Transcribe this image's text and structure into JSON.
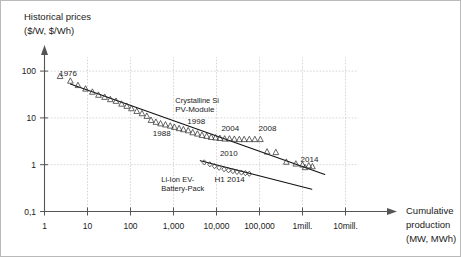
{
  "chart_data": {
    "type": "scatter",
    "title": "",
    "ylabel_lines": [
      "Historical prices",
      "($/W, $/Wh)"
    ],
    "xlabel_lines": [
      "Cumulative",
      "production",
      "(MW, MWh)"
    ],
    "xscale": "log",
    "yscale": "log",
    "xlim": [
      1,
      30000000
    ],
    "ylim": [
      0.1,
      300
    ],
    "grid": true,
    "legend_position": "inline-annotations",
    "xticks": [
      {
        "value": 1,
        "label": "1"
      },
      {
        "value": 10,
        "label": "10"
      },
      {
        "value": 100,
        "label": "100"
      },
      {
        "value": 1000,
        "label": "1,000"
      },
      {
        "value": 10000,
        "label": "10,000"
      },
      {
        "value": 100000,
        "label": "100,000"
      },
      {
        "value": 1000000,
        "label": "1mill."
      },
      {
        "value": 10000000,
        "label": "10mill."
      }
    ],
    "yticks": [
      {
        "value": 100,
        "label": "100"
      },
      {
        "value": 10,
        "label": "10"
      },
      {
        "value": 1,
        "label": "1"
      },
      {
        "value": 0.1,
        "label": "0,1"
      }
    ],
    "annotations": [
      {
        "id": "ann-1976",
        "text": "1976",
        "x": 2.2,
        "y": 80
      },
      {
        "id": "ann-1988",
        "text": "1988",
        "x": 330,
        "y": 4.1
      },
      {
        "id": "ann-1998",
        "text": "1998",
        "x": 2100,
        "y": 7.4
      },
      {
        "id": "ann-2004",
        "text": "2004",
        "x": 13000,
        "y": 5.3
      },
      {
        "id": "ann-2008",
        "text": "2008",
        "x": 95000,
        "y": 5.3
      },
      {
        "id": "ann-2010",
        "text": "2010",
        "x": 12000,
        "y": 1.55
      },
      {
        "id": "ann-2014",
        "text": "2014",
        "x": 900000,
        "y": 1.15
      },
      {
        "id": "ann-h1-2014",
        "text": "H1 2014",
        "x": 9000,
        "y": 0.42
      },
      {
        "id": "ann-crystalline-si-1",
        "text": "Crystalline Si",
        "x": 1100,
        "y": 21
      },
      {
        "id": "ann-crystalline-si-2",
        "text": "PV-Module",
        "x": 1100,
        "y": 13.5
      },
      {
        "id": "ann-liion-1",
        "text": "Li-Ion EV-",
        "x": 520,
        "y": 0.42
      },
      {
        "id": "ann-liion-2",
        "text": "Battery-Pack",
        "x": 520,
        "y": 0.27
      }
    ],
    "series": [
      {
        "name": "Crystalline Si PV-Module",
        "marker": "triangle-up",
        "points": [
          [
            2.3,
            78
          ],
          [
            4.0,
            62
          ],
          [
            6.0,
            50
          ],
          [
            9.0,
            42
          ],
          [
            13,
            36
          ],
          [
            18,
            31
          ],
          [
            25,
            28
          ],
          [
            34,
            25
          ],
          [
            46,
            23
          ],
          [
            62,
            20
          ],
          [
            82,
            18
          ],
          [
            105,
            16
          ],
          [
            140,
            14
          ],
          [
            185,
            12.5
          ],
          [
            240,
            11.0
          ],
          [
            300,
            9.0
          ],
          [
            390,
            8.2
          ],
          [
            500,
            7.6
          ],
          [
            650,
            7.2
          ],
          [
            840,
            6.8
          ],
          [
            1050,
            6.4
          ],
          [
            1350,
            6.0
          ],
          [
            1700,
            5.7
          ],
          [
            2200,
            5.4
          ],
          [
            2800,
            4.9
          ],
          [
            3600,
            4.6
          ],
          [
            4600,
            4.3
          ],
          [
            5900,
            4.1
          ],
          [
            7500,
            3.9
          ],
          [
            9500,
            3.8
          ],
          [
            12000,
            3.7
          ],
          [
            15500,
            3.6
          ],
          [
            20000,
            3.6
          ],
          [
            26000,
            3.55
          ],
          [
            34000,
            3.5
          ],
          [
            44000,
            3.5
          ],
          [
            58000,
            3.5
          ],
          [
            78000,
            3.5
          ],
          [
            105000,
            3.5
          ],
          [
            150000,
            1.9
          ],
          [
            240000,
            1.85
          ],
          [
            420000,
            1.15
          ],
          [
            700000,
            1.05
          ],
          [
            1000000,
            1.0
          ],
          [
            1150000,
            0.88
          ],
          [
            1400000,
            0.96
          ],
          [
            1700000,
            0.92
          ]
        ]
      },
      {
        "name": "Li-Ion EV-Battery-Pack",
        "marker": "diamond",
        "points": [
          [
            5200,
            1.12
          ],
          [
            7000,
            1.02
          ],
          [
            9000,
            0.93
          ],
          [
            11500,
            0.86
          ],
          [
            15000,
            0.8
          ],
          [
            19000,
            0.76
          ],
          [
            24000,
            0.73
          ],
          [
            30000,
            0.7
          ],
          [
            38000,
            0.68
          ],
          [
            47000,
            0.66
          ],
          [
            58000,
            0.64
          ]
        ]
      }
    ],
    "trendlines": [
      {
        "id": "trend-pv",
        "name": "Crystalline Si PV-Module learning curve",
        "x_start": 4.0,
        "y_start": 53,
        "x_end": 3300000,
        "y_end": 0.62
      },
      {
        "id": "trend-liion",
        "name": "Li-Ion EV-Battery-Pack learning curve",
        "x_start": 4200,
        "y_start": 1.22,
        "x_end": 1650000,
        "y_end": 0.3
      }
    ]
  }
}
